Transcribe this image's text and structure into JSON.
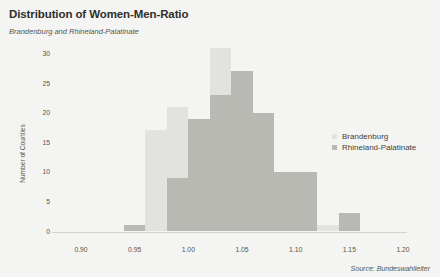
{
  "header": {
    "title": "Distribution of Women-Men-Ratio",
    "subtitle": "Brandenburg and Rhineland-Palatinate"
  },
  "footer": {
    "source": "Source: Bundeswahlleiter"
  },
  "legend": {
    "position": "right-middle",
    "entries": [
      {
        "label": "Brandenburg",
        "color": "#e2e2de",
        "marker": "square-swatch"
      },
      {
        "label": "Rhineland-Palatinate",
        "color": "#b9b9b4",
        "marker": "square-swatch"
      }
    ]
  },
  "chart_data": {
    "type": "bar",
    "title": "Distribution of Women-Men-Ratio",
    "subtitle": "Brandenburg and Rhineland-Palatinate",
    "xlabel": "",
    "ylabel": "Number of Counties",
    "xlim": [
      0.9,
      1.2
    ],
    "ylim": [
      0,
      31
    ],
    "grid": false,
    "bin_width": 0.02,
    "overlap": "overlaid",
    "xticks": [
      "0.90",
      "0.95",
      "1.00",
      "1.05",
      "1.10",
      "1.15",
      "1.20"
    ],
    "xtick_values": [
      0.9,
      0.95,
      1.0,
      1.05,
      1.1,
      1.15,
      1.2
    ],
    "yticks": [
      "0",
      "5",
      "10",
      "15",
      "20",
      "25",
      "30"
    ],
    "ytick_values": [
      0,
      5,
      10,
      15,
      20,
      25,
      30
    ],
    "bins": [
      {
        "start": 0.94,
        "end": 0.96
      },
      {
        "start": 0.96,
        "end": 0.98
      },
      {
        "start": 0.98,
        "end": 1.0
      },
      {
        "start": 1.0,
        "end": 1.02
      },
      {
        "start": 1.02,
        "end": 1.04
      },
      {
        "start": 1.04,
        "end": 1.06
      },
      {
        "start": 1.06,
        "end": 1.08
      },
      {
        "start": 1.08,
        "end": 1.1
      },
      {
        "start": 1.1,
        "end": 1.12
      },
      {
        "start": 1.12,
        "end": 1.14
      },
      {
        "start": 1.14,
        "end": 1.16
      }
    ],
    "series": [
      {
        "name": "Brandenburg",
        "color": "#e2e2de",
        "values": [
          0,
          17,
          21,
          0,
          31,
          0,
          0,
          0,
          0,
          1,
          0
        ]
      },
      {
        "name": "Rhineland-Palatinate",
        "color": "#b9b9b4",
        "values": [
          1,
          0,
          9,
          19,
          23,
          27,
          20,
          10,
          10,
          0,
          3
        ]
      }
    ]
  }
}
